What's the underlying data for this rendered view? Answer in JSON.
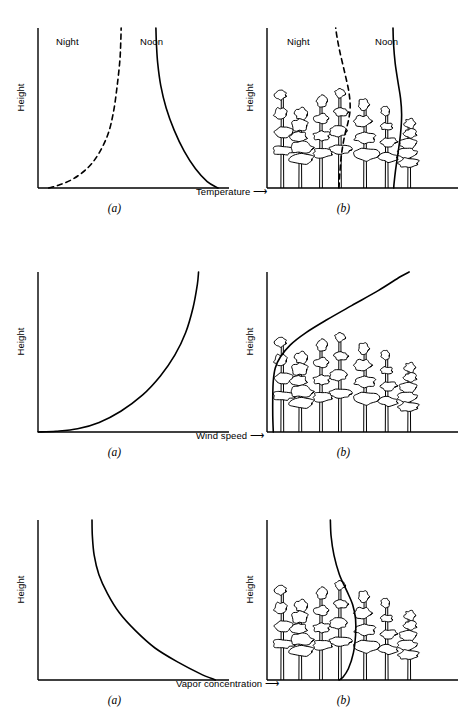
{
  "figure": {
    "background_color": "#ffffff",
    "line_color": "#000000",
    "axis_color": "#000000"
  },
  "common": {
    "ylabel": "Height",
    "caption_a": "(a)",
    "caption_b": "(b)",
    "arrow_glyph": "⟶"
  },
  "rows": [
    {
      "id": "temperature",
      "xlabel": "Temperature",
      "series_labels": {
        "night": "Night",
        "noon": "Noon"
      },
      "panel_a_caption": "(a)",
      "panel_b_caption": "(b)"
    },
    {
      "id": "wind",
      "xlabel": "Wind speed",
      "panel_a_caption": "(a)",
      "panel_b_caption": "(b)"
    },
    {
      "id": "vapor",
      "xlabel": "Vapor concentration",
      "panel_a_caption": "(a)",
      "panel_b_caption": "(b)"
    }
  ],
  "chart_data": [
    {
      "type": "line",
      "id": "temperature-open",
      "panel": "(a)",
      "title": "",
      "xlabel": "Temperature",
      "ylabel": "Height",
      "grid": false,
      "legend": "inline-labels",
      "axis_ranges": {
        "x": [
          0,
          1
        ],
        "y": [
          0,
          1
        ]
      },
      "series": [
        {
          "name": "Night",
          "style": "dashed",
          "note": "temperature inversion: cold at ground, warming with height",
          "points": [
            [
              0.06,
              0.0
            ],
            [
              0.12,
              0.02
            ],
            [
              0.2,
              0.06
            ],
            [
              0.28,
              0.13
            ],
            [
              0.34,
              0.22
            ],
            [
              0.39,
              0.34
            ],
            [
              0.42,
              0.48
            ],
            [
              0.44,
              0.64
            ],
            [
              0.455,
              0.8
            ],
            [
              0.46,
              0.92
            ],
            [
              0.462,
              1.0
            ]
          ]
        },
        {
          "name": "Noon",
          "style": "solid",
          "note": "lapse profile: hot at ground, cooling with height",
          "points": [
            [
              0.655,
              1.0
            ],
            [
              0.658,
              0.9
            ],
            [
              0.665,
              0.78
            ],
            [
              0.682,
              0.64
            ],
            [
              0.712,
              0.5
            ],
            [
              0.757,
              0.36
            ],
            [
              0.812,
              0.23
            ],
            [
              0.875,
              0.12
            ],
            [
              0.94,
              0.04
            ],
            [
              1.0,
              0.0
            ]
          ]
        }
      ]
    },
    {
      "type": "line",
      "id": "temperature-forest",
      "panel": "(b)",
      "title": "",
      "xlabel": "Temperature",
      "ylabel": "Height",
      "grid": false,
      "legend": "inline-labels",
      "axis_ranges": {
        "x": [
          0,
          1
        ],
        "y": [
          0,
          1
        ]
      },
      "scene": "forest canopy",
      "series": [
        {
          "name": "Night",
          "style": "dashed",
          "note": "minimum temperature inside crown layer",
          "points": [
            [
              0.4,
              0.0
            ],
            [
              0.405,
              0.1
            ],
            [
              0.415,
              0.22
            ],
            [
              0.432,
              0.33
            ],
            [
              0.452,
              0.42
            ],
            [
              0.462,
              0.5
            ],
            [
              0.455,
              0.6
            ],
            [
              0.432,
              0.72
            ],
            [
              0.405,
              0.85
            ],
            [
              0.388,
              0.95
            ],
            [
              0.382,
              1.0
            ]
          ]
        },
        {
          "name": "Noon",
          "style": "solid",
          "note": "maximum temperature inside crown layer",
          "points": [
            [
              0.7,
              1.0
            ],
            [
              0.703,
              0.9
            ],
            [
              0.712,
              0.78
            ],
            [
              0.728,
              0.66
            ],
            [
              0.742,
              0.56
            ],
            [
              0.748,
              0.46
            ],
            [
              0.742,
              0.34
            ],
            [
              0.728,
              0.22
            ],
            [
              0.714,
              0.11
            ],
            [
              0.706,
              0.03
            ],
            [
              0.704,
              0.0
            ]
          ]
        }
      ]
    },
    {
      "type": "line",
      "id": "wind-open",
      "panel": "(a)",
      "title": "",
      "xlabel": "Wind speed",
      "ylabel": "Height",
      "grid": false,
      "legend": "none",
      "axis_ranges": {
        "x": [
          0,
          1
        ],
        "y": [
          0,
          1
        ]
      },
      "series": [
        {
          "name": "Wind speed",
          "style": "solid",
          "note": "logarithmic wind profile increasing with height",
          "points": [
            [
              0.0,
              0.0
            ],
            [
              0.1,
              0.005
            ],
            [
              0.22,
              0.02
            ],
            [
              0.34,
              0.06
            ],
            [
              0.46,
              0.13
            ],
            [
              0.58,
              0.23
            ],
            [
              0.68,
              0.35
            ],
            [
              0.76,
              0.48
            ],
            [
              0.82,
              0.62
            ],
            [
              0.862,
              0.78
            ],
            [
              0.885,
              0.92
            ],
            [
              0.892,
              1.0
            ]
          ]
        }
      ]
    },
    {
      "type": "line",
      "id": "wind-forest",
      "panel": "(b)",
      "title": "",
      "xlabel": "Wind speed",
      "ylabel": "Height",
      "grid": false,
      "legend": "none",
      "axis_ranges": {
        "x": [
          0,
          1
        ],
        "y": [
          0,
          1
        ]
      },
      "scene": "forest canopy",
      "series": [
        {
          "name": "Wind speed",
          "style": "solid",
          "note": "near-zero within trunk space, rising sharply above canopy",
          "points": [
            [
              0.035,
              0.0
            ],
            [
              0.032,
              0.1
            ],
            [
              0.032,
              0.22
            ],
            [
              0.035,
              0.32
            ],
            [
              0.046,
              0.4
            ],
            [
              0.075,
              0.47
            ],
            [
              0.13,
              0.545
            ],
            [
              0.215,
              0.62
            ],
            [
              0.33,
              0.7
            ],
            [
              0.47,
              0.79
            ],
            [
              0.62,
              0.885
            ],
            [
              0.74,
              0.97
            ],
            [
              0.79,
              1.0
            ]
          ]
        }
      ]
    },
    {
      "type": "line",
      "id": "vapor-open",
      "panel": "(a)",
      "title": "",
      "xlabel": "Vapor concentration",
      "ylabel": "Height",
      "grid": false,
      "legend": "none",
      "axis_ranges": {
        "x": [
          0,
          1
        ],
        "y": [
          0,
          1
        ]
      },
      "series": [
        {
          "name": "Vapor concentration",
          "style": "solid",
          "note": "highest near evaporating surface, decreasing with height",
          "points": [
            [
              0.3,
              1.0
            ],
            [
              0.302,
              0.9
            ],
            [
              0.312,
              0.78
            ],
            [
              0.338,
              0.66
            ],
            [
              0.386,
              0.54
            ],
            [
              0.452,
              0.42
            ],
            [
              0.54,
              0.31
            ],
            [
              0.65,
              0.2
            ],
            [
              0.78,
              0.11
            ],
            [
              0.9,
              0.04
            ],
            [
              0.985,
              0.0
            ]
          ]
        }
      ]
    },
    {
      "type": "line",
      "id": "vapor-forest",
      "panel": "(b)",
      "title": "",
      "xlabel": "Vapor concentration",
      "ylabel": "Height",
      "grid": false,
      "legend": "none",
      "axis_ranges": {
        "x": [
          0,
          1
        ],
        "y": [
          0,
          1
        ]
      },
      "scene": "forest canopy",
      "series": [
        {
          "name": "Vapor concentration",
          "style": "solid",
          "note": "maximum within crown layer, lower above and in trunk space",
          "points": [
            [
              0.352,
              1.0
            ],
            [
              0.356,
              0.9
            ],
            [
              0.372,
              0.78
            ],
            [
              0.402,
              0.66
            ],
            [
              0.442,
              0.56
            ],
            [
              0.476,
              0.47
            ],
            [
              0.492,
              0.38
            ],
            [
              0.492,
              0.28
            ],
            [
              0.48,
              0.17
            ],
            [
              0.452,
              0.07
            ],
            [
              0.42,
              0.015
            ],
            [
              0.4,
              0.0
            ]
          ]
        }
      ]
    }
  ],
  "forest": {
    "note": "stylised broadleaf trees: slender vertical trunks with stacked irregular crown blobs",
    "scene_temperature": {
      "trees": [
        {
          "x": 0.085,
          "trunk_top": 0.62,
          "crown_w": 0.105,
          "blobs": 4,
          "seed": 11
        },
        {
          "x": 0.185,
          "trunk_top": 0.5,
          "crown_w": 0.115,
          "blobs": 5,
          "seed": 23
        },
        {
          "x": 0.3,
          "trunk_top": 0.58,
          "crown_w": 0.1,
          "blobs": 4,
          "seed": 37
        },
        {
          "x": 0.405,
          "trunk_top": 0.63,
          "crown_w": 0.098,
          "blobs": 4,
          "seed": 41
        },
        {
          "x": 0.545,
          "trunk_top": 0.56,
          "crown_w": 0.12,
          "blobs": 4,
          "seed": 53
        },
        {
          "x": 0.665,
          "trunk_top": 0.52,
          "crown_w": 0.09,
          "blobs": 4,
          "seed": 67
        },
        {
          "x": 0.79,
          "trunk_top": 0.44,
          "crown_w": 0.105,
          "blobs": 5,
          "seed": 79
        }
      ]
    },
    "scene_wind": {
      "trees": [
        {
          "x": 0.085,
          "trunk_top": 0.6,
          "crown_w": 0.105,
          "blobs": 4,
          "seed": 11
        },
        {
          "x": 0.185,
          "trunk_top": 0.5,
          "crown_w": 0.115,
          "blobs": 5,
          "seed": 23
        },
        {
          "x": 0.3,
          "trunk_top": 0.58,
          "crown_w": 0.1,
          "blobs": 4,
          "seed": 37
        },
        {
          "x": 0.405,
          "trunk_top": 0.63,
          "crown_w": 0.098,
          "blobs": 4,
          "seed": 41
        },
        {
          "x": 0.545,
          "trunk_top": 0.56,
          "crown_w": 0.12,
          "blobs": 4,
          "seed": 53
        },
        {
          "x": 0.665,
          "trunk_top": 0.52,
          "crown_w": 0.09,
          "blobs": 4,
          "seed": 67
        },
        {
          "x": 0.79,
          "trunk_top": 0.44,
          "crown_w": 0.105,
          "blobs": 5,
          "seed": 79
        }
      ]
    },
    "scene_vapor": {
      "trees": [
        {
          "x": 0.085,
          "trunk_top": 0.6,
          "crown_w": 0.105,
          "blobs": 4,
          "seed": 11
        },
        {
          "x": 0.185,
          "trunk_top": 0.5,
          "crown_w": 0.115,
          "blobs": 5,
          "seed": 23
        },
        {
          "x": 0.3,
          "trunk_top": 0.58,
          "crown_w": 0.1,
          "blobs": 4,
          "seed": 37
        },
        {
          "x": 0.405,
          "trunk_top": 0.63,
          "crown_w": 0.098,
          "blobs": 4,
          "seed": 41
        },
        {
          "x": 0.545,
          "trunk_top": 0.56,
          "crown_w": 0.12,
          "blobs": 4,
          "seed": 53
        },
        {
          "x": 0.665,
          "trunk_top": 0.52,
          "crown_w": 0.09,
          "blobs": 4,
          "seed": 67
        },
        {
          "x": 0.79,
          "trunk_top": 0.44,
          "crown_w": 0.105,
          "blobs": 5,
          "seed": 79
        }
      ]
    }
  }
}
